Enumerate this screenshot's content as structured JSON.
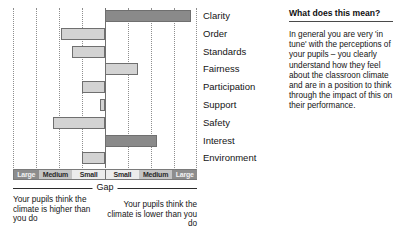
{
  "chart_data": {
    "type": "bar",
    "orientation": "horizontal-diverging",
    "title": "",
    "xlabel": "Gap",
    "ylabel": "",
    "categories": [
      "Clarity",
      "Order",
      "Standards",
      "Fairness",
      "Participation",
      "Support",
      "Safety",
      "Interest",
      "Environment"
    ],
    "values": [
      3.75,
      -1.9,
      -1.45,
      1.45,
      -1.0,
      -0.22,
      -2.25,
      2.25,
      -1.0
    ],
    "value_units": "gridline units (1 unit = one dotted gridline spacing)",
    "xlim": [
      -4,
      4
    ],
    "grid": true,
    "gridline_positions": [
      -4,
      -3,
      -2,
      -1,
      0,
      1,
      2,
      3,
      4
    ],
    "zero_axis": 0,
    "series_colors": {
      "large_gap": "#8a8a8a",
      "small_gap": "#d3d3d3"
    },
    "bar_shading": [
      "dark",
      "light",
      "light",
      "light",
      "light",
      "light",
      "light",
      "dark",
      "light"
    ],
    "legend_position": "none",
    "annotations": [
      "Your pupils think the climate is higher than you do",
      "Your pupils think the climate is lower than you do"
    ],
    "scale_bands": [
      "Large",
      "Medium",
      "Small",
      "Small",
      "Medium",
      "Large"
    ]
  },
  "chart": {
    "axis_label": "Gap",
    "caption_left": "Your pupils think the climate is higher than you do",
    "caption_right": "Your pupils think the climate is lower than you do",
    "bands": [
      {
        "label": "Large",
        "shade": "large"
      },
      {
        "label": "Medium",
        "shade": "medium"
      },
      {
        "label": "Small",
        "shade": "small"
      },
      {
        "label": "Small",
        "shade": "small"
      },
      {
        "label": "Medium",
        "shade": "medium"
      },
      {
        "label": "Large",
        "shade": "large"
      }
    ],
    "items": [
      {
        "label": "Clarity",
        "value": 3.75,
        "shade": "dark"
      },
      {
        "label": "Order",
        "value": -1.9,
        "shade": "light"
      },
      {
        "label": "Standards",
        "value": -1.45,
        "shade": "light"
      },
      {
        "label": "Fairness",
        "value": 1.45,
        "shade": "light"
      },
      {
        "label": "Participation",
        "value": -1.0,
        "shade": "light"
      },
      {
        "label": "Support",
        "value": -0.22,
        "shade": "light"
      },
      {
        "label": "Safety",
        "value": -2.25,
        "shade": "light"
      },
      {
        "label": "Interest",
        "value": 2.25,
        "shade": "dark"
      },
      {
        "label": "Environment",
        "value": -1.0,
        "shade": "light"
      }
    ]
  },
  "panel": {
    "title": "What does this mean?",
    "body": "In general you are very 'in tune' with the perceptions of your pupils – you clearly understand how they feel about the classroon climate and are in a position to think through the impact of this on their performance."
  }
}
